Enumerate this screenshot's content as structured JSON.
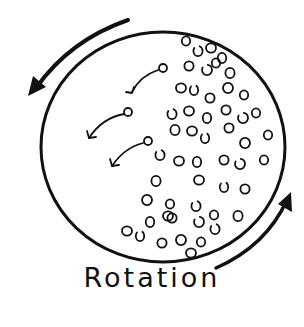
{
  "diagram": {
    "label": "Rotation",
    "ink_color": "#111111",
    "background": "#ffffff",
    "sphere": {
      "cx": 163,
      "cy": 147,
      "rx": 122,
      "ry": 115
    },
    "rotation_direction": "counterclockwise",
    "outer_arrows": [
      {
        "name": "top-left-rotation-arrow",
        "path": "M128,20 Q70,40 34,90",
        "head": [
          34,
          90
        ]
      },
      {
        "name": "bottom-right-rotation-arrow",
        "path": "M216,268 Q268,245 289,196",
        "head": [
          289,
          196
        ]
      }
    ],
    "ejection_arrows": [
      {
        "from": [
          162,
          70
        ],
        "to": [
          131,
          92
        ]
      },
      {
        "from": [
          128,
          113
        ],
        "to": [
          88,
          138
        ]
      },
      {
        "from": [
          148,
          143
        ],
        "to": [
          111,
          167
        ]
      }
    ],
    "particles": [
      [
        186,
        41
      ],
      [
        198,
        51
      ],
      [
        211,
        48
      ],
      [
        222,
        58
      ],
      [
        189,
        66
      ],
      [
        207,
        70
      ],
      [
        216,
        63
      ],
      [
        230,
        73
      ],
      [
        181,
        88
      ],
      [
        194,
        90
      ],
      [
        210,
        98
      ],
      [
        228,
        88
      ],
      [
        244,
        95
      ],
      [
        172,
        114
      ],
      [
        189,
        111
      ],
      [
        207,
        118
      ],
      [
        226,
        110
      ],
      [
        243,
        118
      ],
      [
        256,
        113
      ],
      [
        175,
        130
      ],
      [
        192,
        131
      ],
      [
        205,
        138
      ],
      [
        229,
        128
      ],
      [
        245,
        143
      ],
      [
        268,
        135
      ],
      [
        160,
        155
      ],
      [
        179,
        161
      ],
      [
        197,
        162
      ],
      [
        224,
        160
      ],
      [
        240,
        164
      ],
      [
        264,
        160
      ],
      [
        156,
        181
      ],
      [
        199,
        180
      ],
      [
        224,
        187
      ],
      [
        245,
        189
      ],
      [
        147,
        200
      ],
      [
        170,
        204
      ],
      [
        196,
        206
      ],
      [
        168,
        216
      ],
      [
        150,
        222
      ],
      [
        172,
        218
      ],
      [
        199,
        222
      ],
      [
        214,
        215
      ],
      [
        238,
        216
      ],
      [
        127,
        231
      ],
      [
        140,
        236
      ],
      [
        162,
        243
      ],
      [
        181,
        240
      ],
      [
        201,
        242
      ],
      [
        215,
        229
      ],
      [
        191,
        253
      ]
    ]
  }
}
